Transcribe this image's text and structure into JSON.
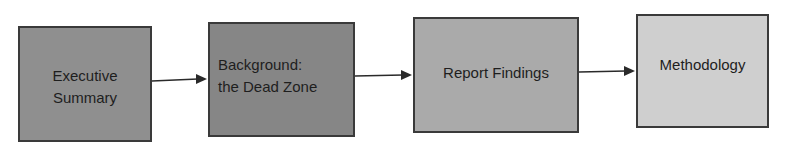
{
  "diagram": {
    "type": "flowchart",
    "direction": "left-to-right",
    "nodes": [
      {
        "id": "n1",
        "label_lines": [
          "Executive",
          "Summary"
        ],
        "fill": "#8f8f8f"
      },
      {
        "id": "n2",
        "label_lines": [
          "Background:",
          "the Dead Zone"
        ],
        "fill": "#868686"
      },
      {
        "id": "n3",
        "label_lines": [
          "Report Findings"
        ],
        "fill": "#aaaaaa"
      },
      {
        "id": "n4",
        "label_lines": [
          "Methodology"
        ],
        "fill": "#cfcfcf"
      }
    ],
    "edges": [
      {
        "from": "n1",
        "to": "n2"
      },
      {
        "from": "n2",
        "to": "n3"
      },
      {
        "from": "n3",
        "to": "n4"
      }
    ],
    "border_color": "#3a3a3a",
    "arrow_color": "#2a2a2a"
  }
}
